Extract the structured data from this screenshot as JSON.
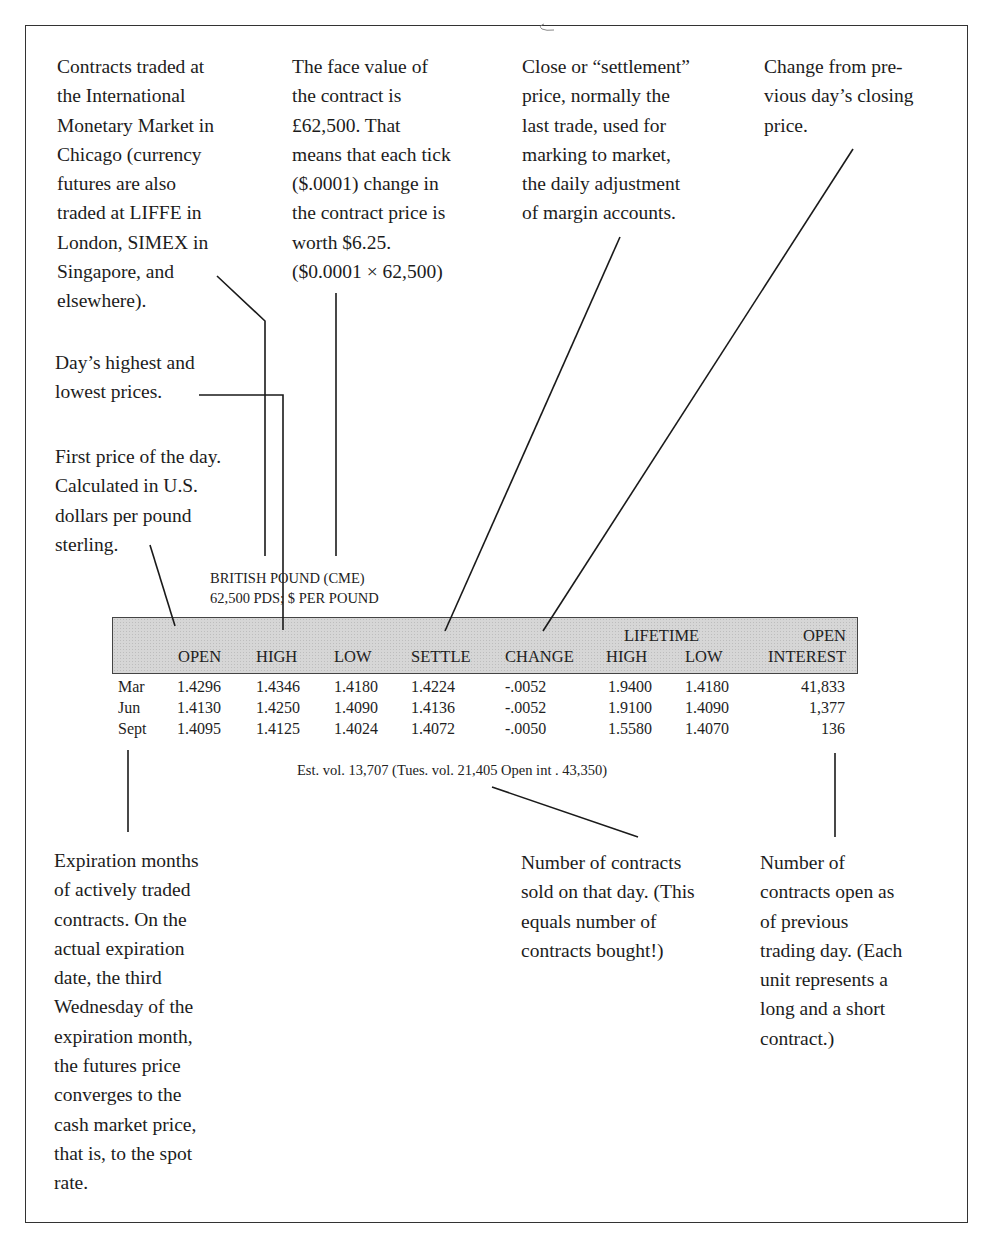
{
  "annotations": {
    "exchange": "Contracts traded at\nthe International\nMonetary Market in\nChicago (currency\nfutures are also\ntraded at LIFFE in\nLondon, SIMEX in\nSingapore, and\nelsewhere).",
    "face_value": "The face value of\nthe contract is\n£62,500. That\nmeans that each tick\n($.0001) change in\nthe contract price is\nworth $6.25.\n($0.0001 × 62,500)",
    "settle": "Close or “settlement”\nprice, normally the\nlast trade, used for\nmarking to market,\nthe daily adjustment\nof margin accounts.",
    "change": "Change from pre-\nvious day’s closing\nprice.",
    "high_low": "Day’s highest and\nlowest prices.",
    "open": "First price of the day.\nCalculated in U.S.\ndollars per pound\nsterling.",
    "expiration": "Expiration months\nof actively traded\ncontracts. On the\nactual expiration\ndate, the third\nWednesday of the\nexpiration month,\nthe futures price\nconverges to the\ncash market price,\nthat is, to the spot\nrate.",
    "volume": "Number of contracts\nsold on that day. (This\nequals number of\ncontracts bought!)",
    "open_interest": "Number of\ncontracts open as\nof previous\ntrading day. (Each\nunit represents a\nlong and a short\ncontract.)"
  },
  "listing": {
    "title": "BRITISH POUND (CME)",
    "subtitle": "62,500 PDS; $ PER POUND",
    "headers": {
      "open": "OPEN",
      "high": "HIGH",
      "low": "LOW",
      "settle": "SETTLE",
      "change": "CHANGE",
      "lifetime": "LIFETIME",
      "lifetime_high": "HIGH",
      "lifetime_low": "LOW",
      "open_interest_top": "OPEN",
      "open_interest_bottom": "INTEREST"
    },
    "rows": [
      {
        "month": "Mar",
        "open": "1.4296",
        "high": "1.4346",
        "low": "1.4180",
        "settle": "1.4224",
        "change": "-.0052",
        "lifetime_high": "1.9400",
        "lifetime_low": "1.4180",
        "open_interest": "41,833"
      },
      {
        "month": "Jun",
        "open": "1.4130",
        "high": "1.4250",
        "low": "1.4090",
        "settle": "1.4136",
        "change": "-.0052",
        "lifetime_high": "1.9100",
        "lifetime_low": "1.4090",
        "open_interest": "1,377"
      },
      {
        "month": "Sept",
        "open": "1.4095",
        "high": "1.4125",
        "low": "1.4024",
        "settle": "1.4072",
        "change": "-.0050",
        "lifetime_high": "1.5580",
        "lifetime_low": "1.4070",
        "open_interest": "136"
      }
    ],
    "footer": "Est. vol. 13,707 (Tues. vol. 21,405 Open int . 43,350)"
  },
  "colors": {
    "frame": "#333333",
    "header_band": "#d6d6d6",
    "text": "#1c1c1c"
  }
}
